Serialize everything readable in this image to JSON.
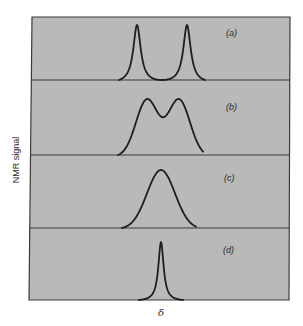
{
  "chart_data": {
    "type": "line",
    "title": "",
    "xlabel": "δ",
    "ylabel": "NMR signal",
    "grid": false,
    "legend": null,
    "panels": [
      {
        "label": "(a)",
        "description": "two sharp, well-separated peaks",
        "peaks": [
          {
            "center": 137,
            "width": 4.5,
            "height": 1.0
          },
          {
            "center": 187,
            "width": 4.5,
            "height": 1.0
          }
        ]
      },
      {
        "label": "(b)",
        "description": "two broadened overlapping peaks with central dip",
        "peaks": [
          {
            "center": 147,
            "width": 11,
            "height": 0.95
          },
          {
            "center": 179,
            "width": 11,
            "height": 0.95
          }
        ]
      },
      {
        "label": "(c)",
        "description": "single broad coalesced peak",
        "peaks": [
          {
            "center": 161,
            "width": 14,
            "height": 1.0
          }
        ]
      },
      {
        "label": "(d)",
        "description": "single sharp averaged peak",
        "peaks": [
          {
            "center": 161,
            "width": 3.2,
            "height": 1.0
          }
        ]
      }
    ],
    "colors": {
      "panel_fill": "#b9b9b9",
      "line": "#1e1e1e",
      "frame": "#3a3a3a"
    }
  },
  "labels": {
    "y_axis": "NMR signal",
    "x_axis": "δ",
    "panels": [
      "(a)",
      "(b)",
      "(c)",
      "(d)"
    ]
  }
}
